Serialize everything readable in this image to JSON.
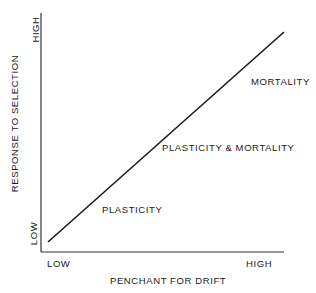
{
  "diagram": {
    "y_axis": {
      "label": "RESPONSE TO SELECTION",
      "low": "LOW",
      "high": "HIGH"
    },
    "x_axis": {
      "label": "PENCHANT FOR DRIFT",
      "low": "LOW",
      "high": "HIGH"
    },
    "regions": [
      {
        "label": "PLASTICITY"
      },
      {
        "label": "PLASTICITY & MORTALITY"
      },
      {
        "label": "MORTALITY"
      }
    ],
    "line": {
      "from": "low-low",
      "to": "high-high",
      "color": "#1a1a1a"
    }
  }
}
